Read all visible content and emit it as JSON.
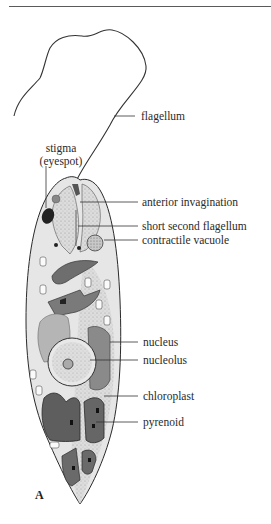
{
  "figure": {
    "panel_letter": "A",
    "labels": {
      "flagellum": "flagellum",
      "stigma": "stigma",
      "eyespot": "(eyespot)",
      "anterior_invagination": "anterior invagination",
      "short_second_flagellum": "short second flagellum",
      "contractile_vacuole": "contractile vacuole",
      "nucleus": "nucleus",
      "nucleolus": "nucleolus",
      "chloroplast": "chloroplast",
      "pyrenoid": "pyrenoid"
    },
    "colors": {
      "cytoplasm": "#d9d9d9",
      "chloroplast": "#7a7a7a",
      "chloroplast_dark": "#555555",
      "outline": "#2a2a2a",
      "label_text": "#2a2a2a"
    }
  }
}
